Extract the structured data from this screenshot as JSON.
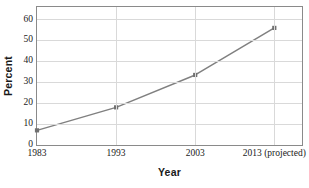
{
  "chart_data": {
    "type": "line",
    "title": "",
    "xlabel": "Year",
    "ylabel": "Percent",
    "categories": [
      "1983",
      "1993",
      "2003",
      "2013 (projected)"
    ],
    "x": [
      1983,
      1993,
      2003,
      2013
    ],
    "values": [
      7,
      18,
      33.5,
      56
    ],
    "series": [
      {
        "name": "Percent",
        "values": [
          7,
          18,
          33.5,
          56
        ],
        "color": "#808080",
        "marker": "square",
        "marker_color": "#707070"
      }
    ],
    "ylim": [
      0,
      66
    ],
    "xlim": [
      1983,
      2016.5
    ],
    "yticks": [
      0,
      10,
      20,
      30,
      40,
      50,
      60
    ],
    "ytick_labels": [
      "0",
      "10",
      "20",
      "30",
      "40",
      "50",
      "60"
    ],
    "xtick_labels": [
      "1983",
      "1993",
      "2003",
      "2013 (projected)"
    ],
    "grid": "horizontal-and-vertical",
    "gridline_color": "#d9d9d9",
    "legend": "none",
    "frame_color": "#8a8a8a",
    "background": "#ffffff"
  }
}
